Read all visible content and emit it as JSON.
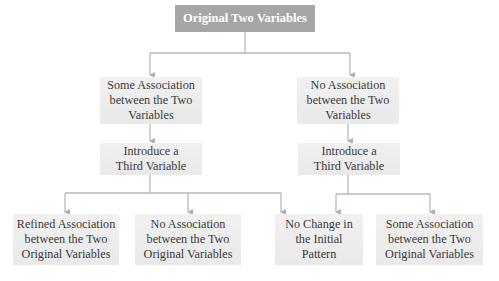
{
  "diagram": {
    "type": "tree-flowchart",
    "colors": {
      "root_fill": "#a6a6a6",
      "root_text": "#ffffff",
      "node_fill": "#eeeeee",
      "node_text": "#3a3a3a",
      "connector": "#b0b0b0"
    },
    "root": {
      "label": "Original Two Variables"
    },
    "level1": [
      {
        "id": "L1a",
        "label": "Some Association\nbetween the Two\nVariables"
      },
      {
        "id": "L1b",
        "label": "No Association\nbetween the Two\nVariables"
      }
    ],
    "level2": [
      {
        "id": "L2a",
        "label": "Introduce a\nThird Variable"
      },
      {
        "id": "L2b",
        "label": "Introduce a\nThird Variable"
      }
    ],
    "level3": [
      {
        "id": "L3a",
        "label": "Refined Association\nbetween the Two\nOriginal Variables"
      },
      {
        "id": "L3b",
        "label": "No Association\nbetween the Two\nOriginal Variables"
      },
      {
        "id": "L3c",
        "label": "No Change in\nthe Initial\nPattern"
      },
      {
        "id": "L3d",
        "label": "Some Association\nbetween the Two\nOriginal Variables"
      }
    ],
    "edges": [
      [
        "root",
        "L1a"
      ],
      [
        "root",
        "L1b"
      ],
      [
        "L1a",
        "L2a"
      ],
      [
        "L1b",
        "L2b"
      ],
      [
        "L2a",
        "L3a"
      ],
      [
        "L2a",
        "L3b"
      ],
      [
        "L2a",
        "L3c"
      ],
      [
        "L2b",
        "L3c"
      ],
      [
        "L2b",
        "L3d"
      ]
    ]
  }
}
